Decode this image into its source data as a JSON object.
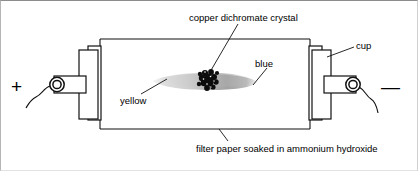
{
  "figure": {
    "type": "labeled-science-diagram",
    "labels": {
      "crystal": "copper dichromate crystal",
      "cup": "cup",
      "blue": "blue",
      "yellow": "yellow",
      "filter_paper": "filter paper soaked in ammonium hydroxide"
    },
    "terminals": {
      "positive": "+",
      "negative": "—"
    },
    "colors": {
      "ink": "#000000",
      "smear_light": "#cfcfcf",
      "smear_dark": "#9e9e9e",
      "crystal": "#101010",
      "page_border": "#8c8c8c",
      "background": "#ffffff"
    },
    "elements": {
      "left_electrode_cup": "cup",
      "right_electrode_cup": "cup",
      "left_lead_wire": "wavy wire from positive terminal",
      "right_lead_wire": "wavy wire to negative terminal",
      "circuit_outline": "rectangular filter paper outline between cups",
      "smear": "gray band spreading from crystal",
      "crystal_cluster": "dark crystal cluster"
    }
  }
}
